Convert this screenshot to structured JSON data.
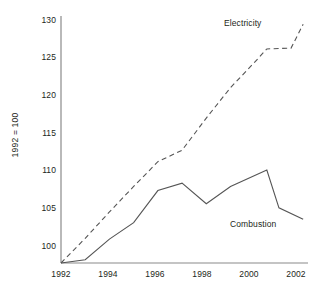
{
  "chart_data": {
    "type": "line",
    "title": "",
    "xlabel": "",
    "ylabel": "1992 = 100",
    "xlim": [
      1992,
      2002.2
    ],
    "ylim": [
      100,
      130
    ],
    "grid": false,
    "legend_position": "inline-annotations",
    "x_ticks": [
      "1992",
      "1994",
      "1996",
      "1998",
      "2000",
      "2002"
    ],
    "x_tick_values": [
      1992,
      1994,
      1996,
      1998,
      2000,
      2002
    ],
    "y_ticks": [
      "100",
      "105",
      "110",
      "115",
      "120",
      "125",
      "130"
    ],
    "y_tick_values": [
      100,
      105,
      110,
      115,
      120,
      125,
      130
    ],
    "x": [
      1992,
      1993,
      1994,
      1995,
      1996,
      1997,
      1998,
      1999,
      2000,
      2000.5,
      2001,
      2002
    ],
    "series": [
      {
        "name": "Electricity",
        "style": "dashed",
        "color": "#555555",
        "x": [
          1992,
          1993,
          1994,
          1995,
          1996,
          1997,
          1998,
          1999,
          2000,
          2000.5,
          2001.5,
          2002
        ],
        "values": [
          100.0,
          103.0,
          106.2,
          109.3,
          112.3,
          113.7,
          117.6,
          121.3,
          124.4,
          126.0,
          126.1,
          129.0
        ]
      },
      {
        "name": "Combustion",
        "style": "solid",
        "color": "#555555",
        "x": [
          1992,
          1993,
          1994,
          1995,
          1996,
          1997,
          1998,
          1999,
          2000.5,
          2001,
          2002
        ],
        "values": [
          100.0,
          100.4,
          102.9,
          104.9,
          108.8,
          109.7,
          107.2,
          109.3,
          111.3,
          106.7,
          105.3
        ]
      }
    ],
    "annotations": [
      {
        "text": "Electricity",
        "x": 2000.6,
        "y": 129.6
      },
      {
        "text": "Combustion",
        "x": 2000.9,
        "y": 104.1
      }
    ]
  },
  "axes": {
    "y_title": "1992 = 100"
  }
}
